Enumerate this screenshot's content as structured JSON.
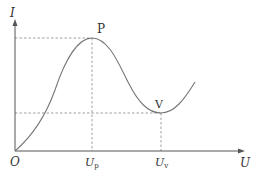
{
  "diagram": {
    "type": "I-V characteristic curve (tunnel diode, negative resistance)",
    "axes": {
      "x_label": "U",
      "y_label": "I",
      "origin_label": "O"
    },
    "points": {
      "peak": {
        "label": "P",
        "x_tick": "U",
        "x_sub": "p"
      },
      "valley": {
        "label": "V",
        "x_tick": "U",
        "x_sub": "v"
      }
    },
    "colors": {
      "curve": "#777777",
      "axes": "#555555",
      "dashed": "#888888",
      "text": "#333333"
    }
  }
}
